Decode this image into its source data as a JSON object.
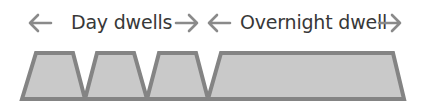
{
  "labels": {
    "day": "Day dwells",
    "overnight": "Overnight dwell"
  },
  "icons": {
    "left_arrow_day": "arrow-left",
    "right_arrow_day": "arrow-right",
    "left_arrow_overnight": "arrow-left",
    "right_arrow_overnight": "arrow-right"
  },
  "colors": {
    "text": "#383838",
    "arrow": "#8a8a8a",
    "fill": "#c9c9c9",
    "stroke": "#848484"
  },
  "blocks": [
    {
      "name": "day-dwell-1",
      "type": "day"
    },
    {
      "name": "day-dwell-2",
      "type": "day"
    },
    {
      "name": "day-dwell-3",
      "type": "day"
    },
    {
      "name": "overnight-dwell",
      "type": "overnight"
    }
  ]
}
